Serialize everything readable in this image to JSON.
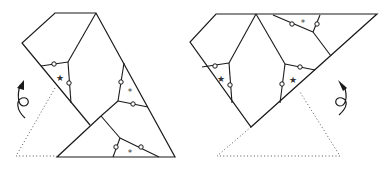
{
  "figure": {
    "colors": {
      "line": "#1a1a1a",
      "dotted": "#555555",
      "background": "#ffffff"
    },
    "marks": {
      "star": "★",
      "asterisk": "*"
    },
    "left": {
      "label": "left-dissection",
      "cell_marks": [
        "★",
        "*",
        "*"
      ],
      "rotation_direction": "counterclockwise-up"
    },
    "right": {
      "label": "right-dissection",
      "cell_marks": [
        "★",
        "★",
        "*"
      ],
      "rotation_direction": "clockwise-up"
    }
  }
}
